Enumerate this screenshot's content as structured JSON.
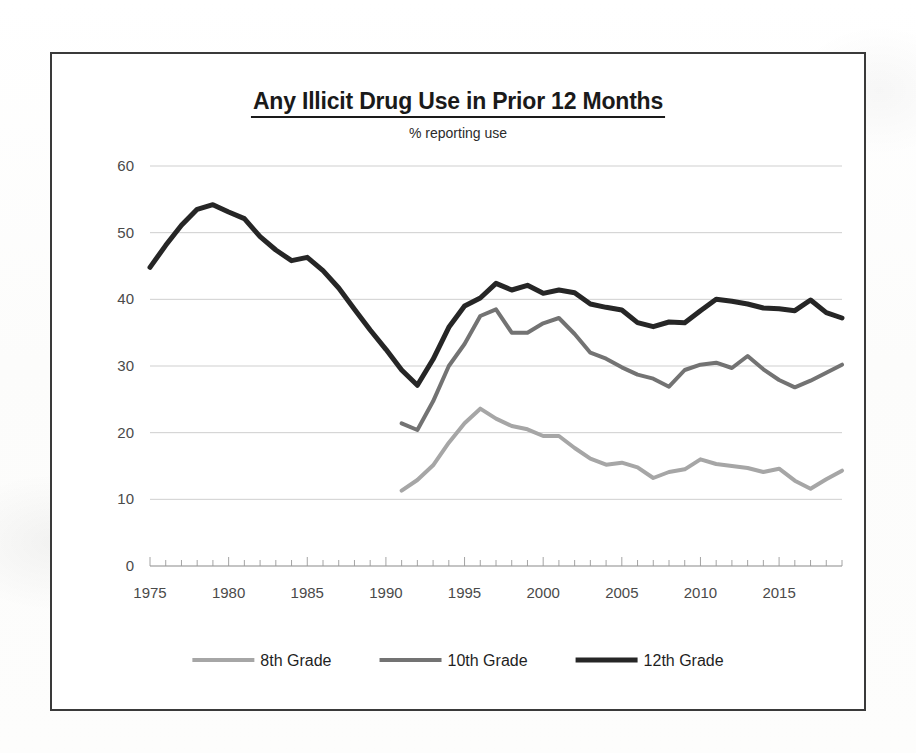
{
  "chart_data": {
    "type": "line",
    "title": "Any Illicit Drug Use in Prior 12 Months",
    "subtitle": "% reporting use",
    "xlabel": "",
    "ylabel": "",
    "xlim": [
      1975,
      2019
    ],
    "ylim": [
      0,
      60
    ],
    "y_ticks": [
      0,
      10,
      20,
      30,
      40,
      50,
      60
    ],
    "x_ticks_labeled": [
      1975,
      1980,
      1985,
      1990,
      1995,
      2000,
      2005,
      2010,
      2015
    ],
    "x_tick_interval": 1,
    "grid": "horizontal",
    "legend_position": "bottom",
    "series": [
      {
        "name": "8th Grade",
        "color": "#a6a6a6",
        "stroke_width": 4,
        "x": [
          1991,
          1992,
          1993,
          1994,
          1995,
          1996,
          1997,
          1998,
          1999,
          2000,
          2001,
          2002,
          2003,
          2004,
          2005,
          2006,
          2007,
          2008,
          2009,
          2010,
          2011,
          2012,
          2013,
          2014,
          2015,
          2016,
          2017,
          2018,
          2019
        ],
        "values": [
          11.3,
          12.9,
          15.1,
          18.5,
          21.4,
          23.6,
          22.1,
          21.0,
          20.5,
          19.5,
          19.5,
          17.7,
          16.1,
          15.2,
          15.5,
          14.8,
          13.2,
          14.1,
          14.5,
          16.0,
          15.3,
          15.0,
          14.7,
          14.1,
          14.6,
          12.8,
          11.6,
          13.0,
          14.3
        ]
      },
      {
        "name": "10th Grade",
        "color": "#737373",
        "stroke_width": 4,
        "x": [
          1991,
          1992,
          1993,
          1994,
          1995,
          1996,
          1997,
          1998,
          1999,
          2000,
          2001,
          2002,
          2003,
          2004,
          2005,
          2006,
          2007,
          2008,
          2009,
          2010,
          2011,
          2012,
          2013,
          2014,
          2015,
          2016,
          2017,
          2018,
          2019
        ],
        "values": [
          21.4,
          20.4,
          24.7,
          30.0,
          33.3,
          37.5,
          38.5,
          35.0,
          35.0,
          36.4,
          37.2,
          34.8,
          32.0,
          31.1,
          29.8,
          28.7,
          28.1,
          26.9,
          29.4,
          30.2,
          30.5,
          29.7,
          31.5,
          29.5,
          27.9,
          26.8,
          27.8,
          29.0,
          30.2
        ]
      },
      {
        "name": "12th Grade",
        "color": "#262626",
        "stroke_width": 5,
        "x": [
          1975,
          1976,
          1977,
          1978,
          1979,
          1980,
          1981,
          1982,
          1983,
          1984,
          1985,
          1986,
          1987,
          1988,
          1989,
          1990,
          1991,
          1992,
          1993,
          1994,
          1995,
          1996,
          1997,
          1998,
          1999,
          2000,
          2001,
          2002,
          2003,
          2004,
          2005,
          2006,
          2007,
          2008,
          2009,
          2010,
          2011,
          2012,
          2013,
          2014,
          2015,
          2016,
          2017,
          2018,
          2019
        ],
        "values": [
          44.8,
          48.1,
          51.1,
          53.5,
          54.2,
          53.1,
          52.1,
          49.4,
          47.4,
          45.8,
          46.3,
          44.3,
          41.7,
          38.5,
          35.4,
          32.5,
          29.4,
          27.1,
          31.0,
          35.8,
          39.0,
          40.2,
          42.4,
          41.4,
          42.1,
          40.9,
          41.4,
          41.0,
          39.3,
          38.8,
          38.4,
          36.5,
          35.9,
          36.6,
          36.5,
          38.3,
          40.0,
          39.7,
          39.3,
          38.7,
          38.6,
          38.3,
          39.9,
          38.0,
          37.2
        ]
      }
    ]
  },
  "legend": {
    "items": [
      {
        "label": "8th Grade"
      },
      {
        "label": "10th Grade"
      },
      {
        "label": "12th Grade"
      }
    ]
  }
}
